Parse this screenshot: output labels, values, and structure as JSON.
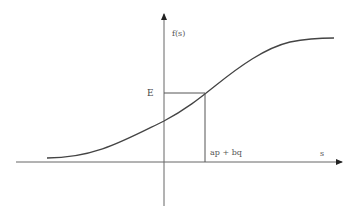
{
  "diagram": {
    "y_axis_label": "f(s)",
    "x_axis_label": "s",
    "e_label": "E",
    "x_point_label": "ap + bq",
    "colors": {
      "axis": "#555555",
      "curve": "#444444",
      "guide": "#555555"
    }
  }
}
